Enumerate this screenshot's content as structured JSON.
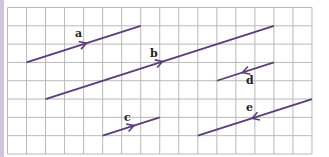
{
  "figure": {
    "type": "vector grid diagram",
    "grid": {
      "columns": 16,
      "rows": 8,
      "origin_x": 7.5,
      "origin_y": 7.5,
      "cell_w": 19.03,
      "cell_h": 18.31,
      "line_color": "#b9b9b9",
      "border_color": "#cfc6dc"
    },
    "vector_color": "#5a3d78",
    "vectors": [
      {
        "label": "a",
        "from": [
          1,
          3
        ],
        "to": [
          7,
          1
        ],
        "arrow_dir": "forward",
        "label_pos": [
          75,
          37
        ]
      },
      {
        "label": "b",
        "from": [
          2,
          5
        ],
        "to": [
          14,
          1
        ],
        "arrow_dir": "forward",
        "label_pos": [
          150,
          57
        ]
      },
      {
        "label": "c",
        "from": [
          5,
          7
        ],
        "to": [
          8,
          6
        ],
        "arrow_dir": "forward",
        "label_pos": [
          124,
          121
        ]
      },
      {
        "label": "d",
        "from": [
          11,
          4
        ],
        "to": [
          14,
          3
        ],
        "arrow_dir": "backward",
        "label_pos": [
          246,
          84
        ]
      },
      {
        "label": "e",
        "from": [
          10,
          7
        ],
        "to": [
          16,
          5
        ],
        "arrow_dir": "backward",
        "label_pos": [
          246,
          111
        ]
      }
    ]
  }
}
